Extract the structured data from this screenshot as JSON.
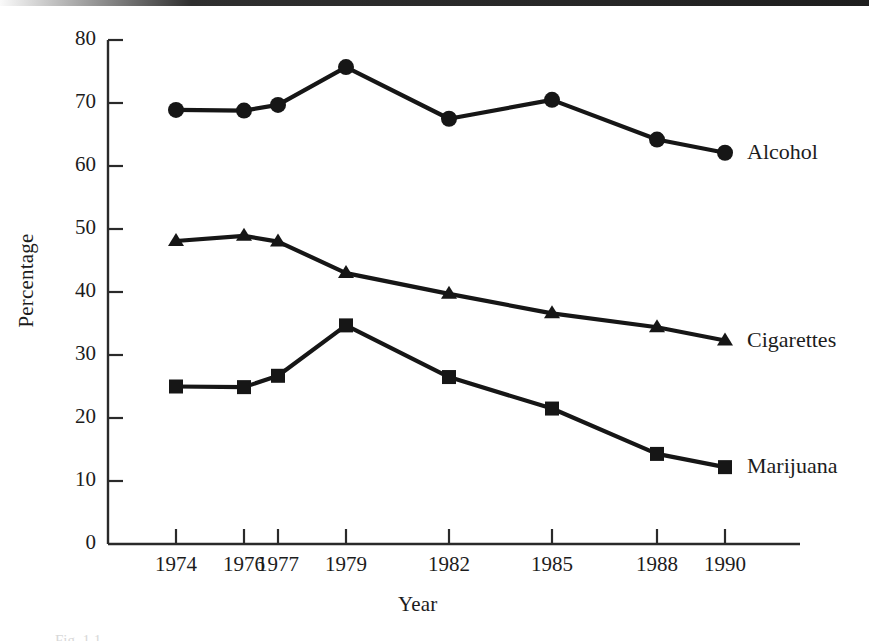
{
  "figure": {
    "background_color": "#ffffff",
    "ink_color": "#161616",
    "caption_fragment": "Fig. 1.1"
  },
  "chart_data": {
    "type": "line",
    "title": "",
    "xlabel": "Year",
    "ylabel": "Percentage",
    "categories": [
      "1974",
      "1976",
      "1977",
      "1979",
      "1982",
      "1985",
      "1988",
      "1990"
    ],
    "x_positions": [
      176,
      244,
      278,
      346,
      449,
      552,
      657,
      725
    ],
    "xtick_labels": [
      "1974",
      "1976",
      "1977",
      "1979",
      "1982",
      "1985",
      "1988",
      "1990"
    ],
    "ytick_labels": [
      "0",
      "10",
      "20",
      "30",
      "40",
      "50",
      "60",
      "70",
      "80"
    ],
    "ytick_values": [
      0,
      10,
      20,
      30,
      40,
      50,
      60,
      70,
      80
    ],
    "ylim": [
      0,
      80
    ],
    "grid": false,
    "legend_position": "right-of-line-ends",
    "series": [
      {
        "name": "Alcohol",
        "marker": "circle",
        "values": [
          68.9,
          68.8,
          69.7,
          75.7,
          67.5,
          70.5,
          64.2,
          62.1
        ],
        "label": "Alcohol"
      },
      {
        "name": "Cigarettes",
        "marker": "triangle",
        "values": [
          48.1,
          48.9,
          48.0,
          43.0,
          39.7,
          36.6,
          34.4,
          32.3
        ],
        "label": "Cigarettes"
      },
      {
        "name": "Marijuana",
        "marker": "square",
        "values": [
          25.0,
          24.9,
          26.7,
          34.7,
          26.5,
          21.5,
          14.3,
          12.2
        ],
        "label": "Marijuana"
      }
    ]
  }
}
